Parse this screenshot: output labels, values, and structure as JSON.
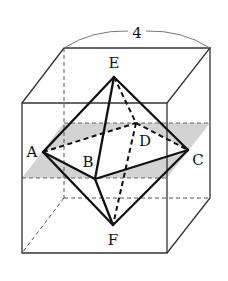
{
  "figure": {
    "dimension_label": "4",
    "colors": {
      "plane_fill": "#d3d3d3",
      "line": "#111111",
      "cube_line": "#333333"
    }
  },
  "vertices": {
    "A": {
      "label": "A",
      "x": 43,
      "y": 152
    },
    "B": {
      "label": "B",
      "x": 95,
      "y": 179
    },
    "C": {
      "label": "C",
      "x": 188,
      "y": 150
    },
    "D": {
      "label": "D",
      "x": 136,
      "y": 123
    },
    "E": {
      "label": "E",
      "x": 114,
      "y": 77
    },
    "F": {
      "label": "F",
      "x": 113,
      "y": 225
    }
  },
  "labels": {
    "A": "A",
    "B": "B",
    "C": "C",
    "D": "D",
    "E": "E",
    "F": "F"
  },
  "edges": {
    "solid": [
      "EA",
      "EB",
      "EC",
      "FA",
      "FB",
      "FC",
      "AB",
      "BC"
    ],
    "dashed": [
      "AD",
      "DC",
      "ED",
      "DF"
    ]
  },
  "cube": {
    "edge_length": "4",
    "front_top_left": [
      22,
      103
    ],
    "front_top_right": [
      167,
      103
    ],
    "front_bottom_left": [
      22,
      253
    ],
    "front_bottom_right": [
      167,
      253
    ],
    "back_top_left": [
      64,
      48
    ],
    "back_top_right": [
      210,
      48
    ],
    "back_bottom_left": [
      64,
      198
    ],
    "back_bottom_right": [
      210,
      198
    ]
  }
}
